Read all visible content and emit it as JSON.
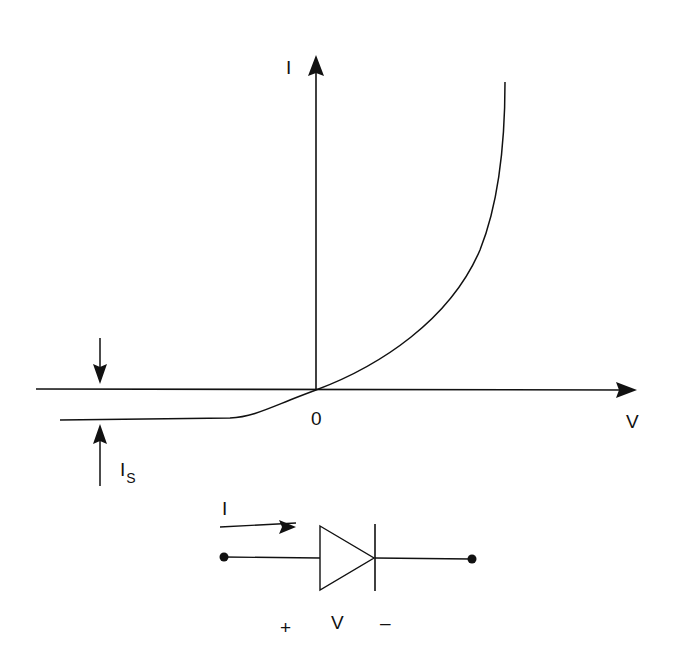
{
  "diagram": {
    "axes": {
      "y_label": "I",
      "x_label": "V",
      "origin_label": "0"
    },
    "saturation_current": {
      "label": "I",
      "subscript": "S"
    },
    "circuit": {
      "current_label": "I",
      "plus_label": "+",
      "voltage_label": "V",
      "minus_label": "–"
    },
    "colors": {
      "stroke": "#111111",
      "background": "#ffffff"
    }
  }
}
